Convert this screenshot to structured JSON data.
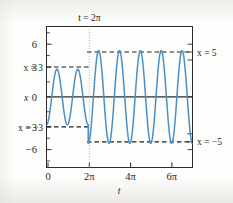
{
  "figure": {
    "background_color": "#fdfdfc",
    "frame_color": "#2b2b2b",
    "curve_color": "#4a90c4",
    "guide_color": "#1f1f1f",
    "divider_color": "#b9b6ad"
  },
  "labels": {
    "top_annotation": "t = 2π",
    "left_upper": "x = 3",
    "left_lower": "x = −3",
    "right_upper": "x = 5",
    "right_lower": "x = −5",
    "y_axis_name": "x",
    "x_axis_name": "t"
  },
  "chart_data": {
    "type": "line",
    "title": "",
    "xlabel": "t",
    "ylabel": "x",
    "xlim": [
      0,
      21.99
    ],
    "ylim": [
      -7.6,
      7.6
    ],
    "grid": false,
    "legend": null,
    "x_ticks": [
      {
        "value": 0,
        "label": "0"
      },
      {
        "value": 6.2832,
        "label": "2π"
      },
      {
        "value": 12.5664,
        "label": "4π"
      },
      {
        "value": 18.8496,
        "label": "6π"
      }
    ],
    "y_ticks": [
      {
        "value": 6,
        "label": "6"
      },
      {
        "value": 3,
        "label": "3"
      },
      {
        "value": 0,
        "label": "0"
      },
      {
        "value": -3,
        "label": "−3"
      },
      {
        "value": -6,
        "label": "−6"
      }
    ],
    "y_minor_ticks": [
      7.5,
      4.5,
      1.5,
      -1.5,
      -4.5,
      -7.5
    ],
    "series": [
      {
        "name": "x(t)",
        "color": "#4a90c4",
        "segments": [
          {
            "name": "amplitude-3-segment",
            "t_start": 0,
            "t_end": 6.2832,
            "amplitude": 3,
            "period": 3.1416,
            "phase_form": "-3*cos(2t)"
          },
          {
            "name": "amplitude-5-segment",
            "t_start": 6.2832,
            "t_end": 21.99,
            "amplitude": 5,
            "period": 3.1416,
            "phase_form": "-5*cos(2t)"
          }
        ]
      }
    ],
    "reference_lines": [
      {
        "name": "x-equals-3",
        "axis": "y",
        "value": 3,
        "style": "dashed",
        "t_start": 0,
        "t_end": 6.2832,
        "label": "x = 3"
      },
      {
        "name": "x-equals-minus-3",
        "axis": "y",
        "value": -3,
        "style": "dashed",
        "t_start": 0,
        "t_end": 6.2832,
        "label": "x = −3"
      },
      {
        "name": "x-equals-5",
        "axis": "y",
        "value": 5,
        "style": "dashed",
        "t_start": 6.2832,
        "t_end": 21.99,
        "label": "x = 5"
      },
      {
        "name": "x-equals-minus-5",
        "axis": "y",
        "value": -5,
        "style": "dashed",
        "t_start": 6.2832,
        "t_end": 21.99,
        "label": "x = −5"
      },
      {
        "name": "t-equals-2pi",
        "axis": "x",
        "value": 6.2832,
        "style": "dotted",
        "label": "t = 2π"
      },
      {
        "name": "x-axis-zero",
        "axis": "y",
        "value": 0,
        "style": "solid",
        "label": ""
      }
    ]
  }
}
